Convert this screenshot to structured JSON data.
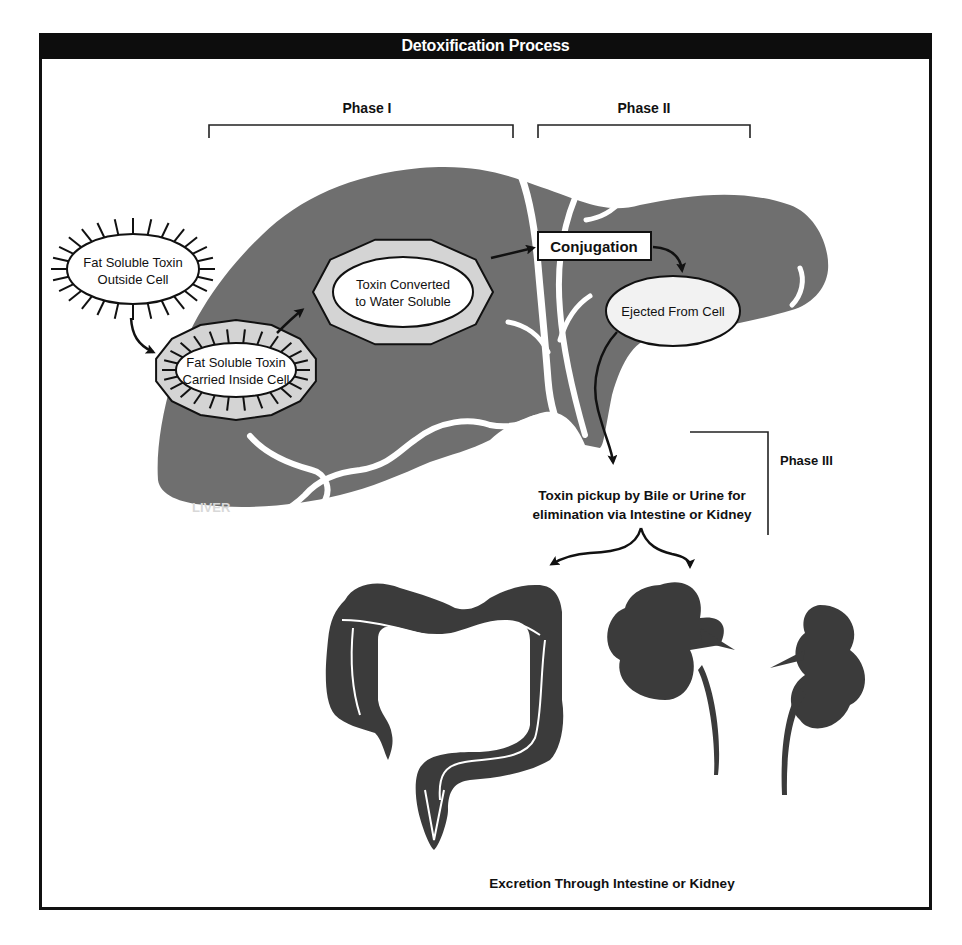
{
  "title": "Detoxification Process",
  "phases": {
    "phase1": "Phase I",
    "phase2": "Phase II",
    "phase3": "Phase III"
  },
  "organ_label": "LIVER",
  "steps": {
    "outside_cell": [
      "Fat Soluble Toxin",
      "Outside Cell"
    ],
    "inside_cell": [
      "Fat Soluble Toxin",
      "Carried Inside Cell"
    ],
    "converted": [
      "Toxin Converted",
      "to Water Soluble"
    ],
    "conjugation": "Conjugation",
    "ejected": "Ejected From Cell"
  },
  "pickup_text": [
    "Toxin pickup by Bile or Urine for",
    "elimination via Intestine or Kidney"
  ],
  "excretion_text": "Excretion Through Intestine or Kidney",
  "colors": {
    "liver": "#6f6f6f",
    "organs": "#3b3b3b",
    "cell_ring": "#d4d4d4",
    "frame": "#111111"
  }
}
